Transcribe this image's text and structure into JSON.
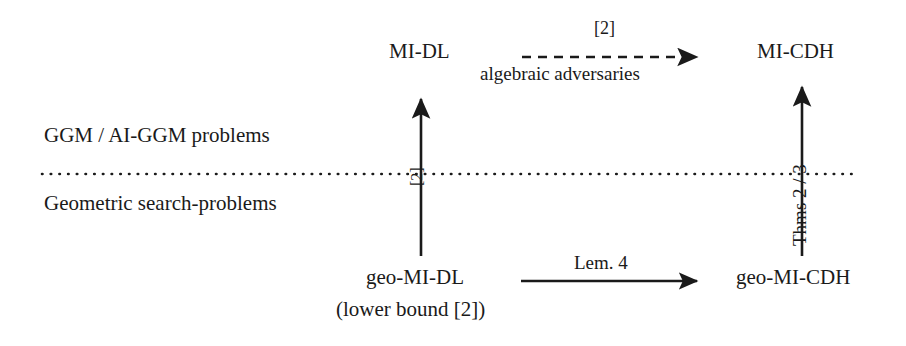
{
  "diagram": {
    "nodes": [
      {
        "id": "mi-dl",
        "label": "MI-DL",
        "x": 389,
        "y": 41
      },
      {
        "id": "mi-cdh",
        "label": "MI-CDH",
        "x": 757,
        "y": 41
      },
      {
        "id": "geo-mi-dl",
        "label": "geo-MI-DL",
        "x": 366,
        "y": 267
      },
      {
        "id": "geo-mi-cdh",
        "label": "geo-MI-CDH",
        "x": 736,
        "y": 267
      }
    ],
    "annotations": [
      {
        "id": "geo-mi-dl-note",
        "label": "(lower bound [2])",
        "x": 336,
        "y": 299
      }
    ],
    "regions": [
      {
        "id": "upper-region",
        "label": "GGM / AI-GGM problems",
        "x": 44,
        "y": 125
      },
      {
        "id": "lower-region",
        "label": "Geometric search-problems",
        "x": 44,
        "y": 193
      }
    ],
    "separator": {
      "id": "ggm-geometric-divider",
      "style": "dotted",
      "x1": 42,
      "x2": 857,
      "y": 174
    },
    "edges": [
      {
        "id": "algebraic-reduction",
        "from": "mi-dl",
        "to": "mi-cdh",
        "style": "dashed",
        "orientation": "horizontal",
        "label_above": "[2]",
        "label_below": "algebraic adversaries",
        "x1": 522,
        "x2": 702,
        "y": 57
      },
      {
        "id": "lem4-reduction",
        "from": "geo-mi-dl",
        "to": "geo-mi-cdh",
        "style": "solid",
        "orientation": "horizontal",
        "label_above": "Lem. 4",
        "label_below": "",
        "x1": 521,
        "x2": 702,
        "y": 281
      },
      {
        "id": "geo-mi-dl-to-mi-dl",
        "from": "geo-mi-dl",
        "to": "mi-dl",
        "style": "solid",
        "orientation": "vertical",
        "label_rotated": "[2]",
        "x": 421,
        "y1": 256,
        "y2": 92
      },
      {
        "id": "geo-mi-cdh-to-mi-cdh",
        "from": "geo-mi-cdh",
        "to": "mi-cdh",
        "style": "solid",
        "orientation": "vertical",
        "label_rotated": "Thms 2 / 3",
        "x": 802,
        "y1": 256,
        "y2": 80
      }
    ],
    "colors": {
      "ink": "#1a1a1a",
      "background": "#ffffff"
    }
  }
}
